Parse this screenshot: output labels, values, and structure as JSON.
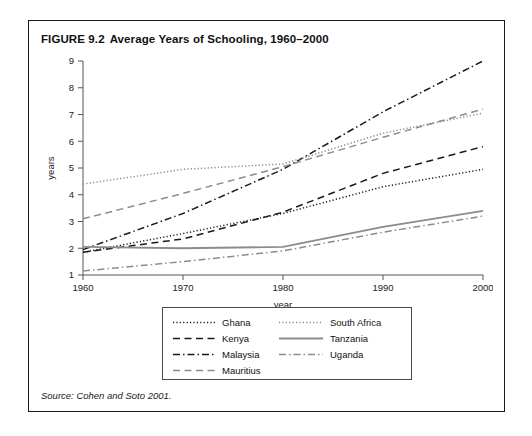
{
  "figure": {
    "number": "FIGURE 9.2",
    "title": "Average Years of Schooling, 1960–2000",
    "source": "Source: Cohen and Soto 2001."
  },
  "chart_data": {
    "type": "line",
    "title": "Average Years of Schooling, 1960–2000",
    "xlabel": "year",
    "ylabel": "years",
    "x": [
      1960,
      1970,
      1980,
      1990,
      2000
    ],
    "xlim": [
      1960,
      2000
    ],
    "ylim": [
      1,
      9
    ],
    "xticks": [
      "1960",
      "1970",
      "1980",
      "1990",
      "2000"
    ],
    "yticks": [
      "1",
      "2",
      "3",
      "4",
      "5",
      "6",
      "7",
      "8",
      "9"
    ],
    "grid": false,
    "legend_position": "below-axes",
    "series": [
      {
        "name": "Ghana",
        "values": [
          1.85,
          2.55,
          3.3,
          4.3,
          4.95
        ],
        "color": "#1a1a1a",
        "style": "dotted"
      },
      {
        "name": "Kenya",
        "values": [
          1.85,
          2.35,
          3.35,
          4.8,
          5.8
        ],
        "color": "#1a1a1a",
        "style": "dashed"
      },
      {
        "name": "Malaysia",
        "values": [
          1.95,
          3.3,
          4.95,
          7.1,
          9.0
        ],
        "color": "#1a1a1a",
        "style": "dashdot"
      },
      {
        "name": "Mauritius",
        "values": [
          3.1,
          4.05,
          5.05,
          6.15,
          7.2
        ],
        "color": "#8c8c8c",
        "style": "dashed"
      },
      {
        "name": "South Africa",
        "values": [
          4.4,
          4.95,
          5.15,
          6.3,
          7.05
        ],
        "color": "#8c8c8c",
        "style": "dotted"
      },
      {
        "name": "Tanzania",
        "values": [
          2.05,
          2.0,
          2.05,
          2.8,
          3.4
        ],
        "color": "#8c8c8c",
        "style": "solid"
      },
      {
        "name": "Uganda",
        "values": [
          1.15,
          1.5,
          1.9,
          2.6,
          3.2
        ],
        "color": "#8c8c8c",
        "style": "dashdot"
      }
    ]
  },
  "legend": {
    "column1": [
      {
        "label": "Ghana",
        "color": "#1a1a1a",
        "style": "dotted"
      },
      {
        "label": "Kenya",
        "color": "#1a1a1a",
        "style": "dashed"
      },
      {
        "label": "Malaysia",
        "color": "#1a1a1a",
        "style": "dashdot"
      },
      {
        "label": "Mauritius",
        "color": "#8c8c8c",
        "style": "dashed"
      }
    ],
    "column2": [
      {
        "label": "South Africa",
        "color": "#8c8c8c",
        "style": "dotted"
      },
      {
        "label": "Tanzania",
        "color": "#8c8c8c",
        "style": "solid"
      },
      {
        "label": "Uganda",
        "color": "#8c8c8c",
        "style": "dashdot"
      }
    ]
  }
}
